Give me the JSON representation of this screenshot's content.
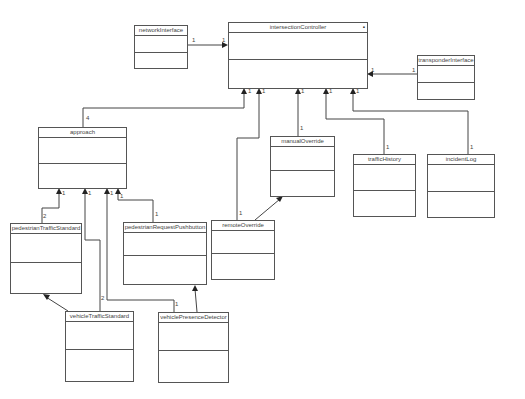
{
  "diagram": {
    "type": "UML class diagram",
    "classes": [
      {
        "id": "networkInterface",
        "name": "networkInterface"
      },
      {
        "id": "intersectionController",
        "name": "intersectionController",
        "marker": "▪"
      },
      {
        "id": "transponderInterface",
        "name": "transponderInterface"
      },
      {
        "id": "approach",
        "name": "approach"
      },
      {
        "id": "manualOverride",
        "name": "manualOverride"
      },
      {
        "id": "trafficHistory",
        "name": "trafficHistory"
      },
      {
        "id": "incidentLog",
        "name": "incidentLog"
      },
      {
        "id": "pedestrianTrafficStandard",
        "name": "pedestrianTrafficStandard"
      },
      {
        "id": "pedestrianRequestPushbutton",
        "name": "pedestrianRequestPushbutton"
      },
      {
        "id": "remoteOverride",
        "name": "remoteOverride"
      },
      {
        "id": "vehicleTrafficStandard",
        "name": "vehicleTrafficStandard"
      },
      {
        "id": "vehiclePresenceDetector",
        "name": "vehiclePresenceDetector"
      }
    ],
    "associations": [
      {
        "from": "networkInterface",
        "to": "intersectionController",
        "from_mult": "1",
        "to_mult": "1"
      },
      {
        "from": "transponderInterface",
        "to": "intersectionController",
        "from_mult": "1",
        "to_mult": "1"
      },
      {
        "from": "approach",
        "to": "intersectionController",
        "from_mult": "4",
        "to_mult": "1"
      },
      {
        "from": "remoteOverride",
        "to": "intersectionController",
        "from_mult": "1",
        "to_mult": "1"
      },
      {
        "from": "manualOverride",
        "to": "intersectionController",
        "from_mult": "1",
        "to_mult": "1"
      },
      {
        "from": "trafficHistory",
        "to": "intersectionController",
        "from_mult": "1",
        "to_mult": "1"
      },
      {
        "from": "incidentLog",
        "to": "intersectionController",
        "from_mult": "1",
        "to_mult": "1"
      },
      {
        "from": "pedestrianTrafficStandard",
        "to": "approach",
        "from_mult": "2",
        "to_mult": "1"
      },
      {
        "from": "vehicleTrafficStandard",
        "to": "approach",
        "from_mult": "2",
        "to_mult": "1"
      },
      {
        "from": "vehiclePresenceDetector",
        "to": "approach",
        "from_mult": "1",
        "to_mult": "1"
      },
      {
        "from": "pedestrianRequestPushbutton",
        "to": "approach",
        "from_mult": "1",
        "to_mult": "1"
      },
      {
        "from": "remoteOverride",
        "to": "manualOverride"
      },
      {
        "from": "vehicleTrafficStandard",
        "to": "pedestrianTrafficStandard"
      },
      {
        "from": "vehiclePresenceDetector",
        "to": "pedestrianRequestPushbutton"
      }
    ]
  },
  "mult": {
    "one": "1",
    "two": "2",
    "four": "4"
  }
}
